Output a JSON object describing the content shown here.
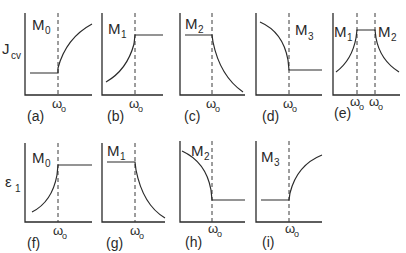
{
  "figure": {
    "row1_ylabel": {
      "main": "J",
      "sub": "cv"
    },
    "row2_ylabel": {
      "main": "ε",
      "sub": "1"
    },
    "xtick": {
      "main": "ω",
      "sub": "o"
    },
    "panels": [
      {
        "id": "a",
        "caption": "(a)",
        "mode": {
          "main": "M",
          "sub": "0"
        },
        "shape": "flat-low then rising after ω0"
      },
      {
        "id": "b",
        "caption": "(b)",
        "mode": {
          "main": "M",
          "sub": "1"
        },
        "shape": "rising up to ω0 then flat-high"
      },
      {
        "id": "c",
        "caption": "(c)",
        "mode": {
          "main": "M",
          "sub": "2"
        },
        "shape": "flat-high then decaying after ω0"
      },
      {
        "id": "d",
        "caption": "(d)",
        "mode": {
          "main": "M",
          "sub": "3"
        },
        "shape": "decaying to ω0 then flat-low"
      },
      {
        "id": "e",
        "caption": "(e)",
        "mode_left": {
          "main": "M",
          "sub": "1"
        },
        "mode_right": {
          "main": "M",
          "sub": "2"
        },
        "shape": "rising, plateau between two ω0, decaying"
      },
      {
        "id": "f",
        "caption": "(f)",
        "mode": {
          "main": "M",
          "sub": "0"
        },
        "shape": "rising up to ω0 then flat-high"
      },
      {
        "id": "g",
        "caption": "(g)",
        "mode": {
          "main": "M",
          "sub": "1"
        },
        "shape": "flat-high then decaying after ω0"
      },
      {
        "id": "h",
        "caption": "(h)",
        "mode": {
          "main": "M",
          "sub": "2"
        },
        "shape": "decaying to ω0 then flat-low"
      },
      {
        "id": "i",
        "caption": "(i)",
        "mode": {
          "main": "M",
          "sub": "3"
        },
        "shape": "flat-low then rising after ω0"
      }
    ]
  }
}
